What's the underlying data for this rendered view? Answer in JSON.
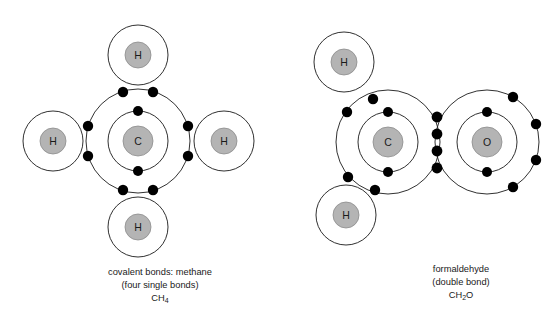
{
  "figure": {
    "background_color": "#ffffff",
    "nucleus_fill": "#b4b4b4",
    "shell_stroke": "#1a1a1a",
    "electron_fill": "#000000"
  },
  "panels": [
    {
      "id": "methane",
      "caption_line1": "covalent bonds: methane",
      "caption_line2": "(four single bonds)",
      "formula_main": "CH",
      "formula_sub": "4",
      "formula_full": "CH4",
      "central_atom": {
        "symbol": "C",
        "name": "carbon",
        "cx": 138,
        "cy": 141,
        "nucleus_r": 15,
        "shells": [
          {
            "r": 30,
            "electrons": 2
          },
          {
            "r": 52,
            "electrons": 8
          }
        ],
        "inner_shell_electron_angles": [
          -90,
          90
        ],
        "bond_count": 4
      },
      "outer_atoms": [
        {
          "symbol": "H",
          "name": "hydrogen",
          "cx": 138,
          "cy": 55,
          "nucleus_r": 13,
          "shell_r": 30,
          "position": "top"
        },
        {
          "symbol": "H",
          "name": "hydrogen",
          "cx": 53,
          "cy": 141,
          "nucleus_r": 13,
          "shell_r": 30,
          "position": "left"
        },
        {
          "symbol": "H",
          "name": "hydrogen",
          "cx": 224,
          "cy": 141,
          "nucleus_r": 13,
          "shell_r": 30,
          "position": "right"
        },
        {
          "symbol": "H",
          "name": "hydrogen",
          "cx": 138,
          "cy": 227,
          "nucleus_r": 13,
          "shell_r": 30,
          "position": "bottom"
        }
      ],
      "bonds": [
        {
          "type": "single",
          "between": "C-H",
          "direction": "up",
          "shared_electrons": 2,
          "dots": [
            {
              "x": 123,
              "y": 92
            },
            {
              "x": 153,
              "y": 92
            }
          ]
        },
        {
          "type": "single",
          "between": "C-H",
          "direction": "left",
          "shared_electrons": 2,
          "dots": [
            {
              "x": 88,
              "y": 126
            },
            {
              "x": 88,
              "y": 156
            }
          ]
        },
        {
          "type": "single",
          "between": "C-H",
          "direction": "right",
          "shared_electrons": 2,
          "dots": [
            {
              "x": 188,
              "y": 126
            },
            {
              "x": 188,
              "y": 156
            }
          ]
        },
        {
          "type": "single",
          "between": "C-H",
          "direction": "down",
          "shared_electrons": 2,
          "dots": [
            {
              "x": 123,
              "y": 190
            },
            {
              "x": 153,
              "y": 190
            }
          ]
        }
      ],
      "caption_x": 160,
      "caption_y": 275
    },
    {
      "id": "formaldehyde",
      "caption_line1": "formaldehyde",
      "caption_line2": "(double bond)",
      "formula_main": "CH",
      "formula_sub": "2",
      "formula_tail": "O",
      "formula_full": "CH2O",
      "central_atom": {
        "symbol": "C",
        "name": "carbon",
        "cx": 388,
        "cy": 142,
        "nucleus_r": 15,
        "shells": [
          {
            "r": 30,
            "electrons": 2
          },
          {
            "r": 52,
            "electrons": 8
          }
        ],
        "inner_shell_electron_angles": [
          -90,
          90
        ],
        "bond_count": 3
      },
      "second_atom": {
        "symbol": "O",
        "name": "oxygen",
        "cx": 487,
        "cy": 142,
        "nucleus_r": 15,
        "shells": [
          {
            "r": 30,
            "electrons": 4
          },
          {
            "r": 52,
            "electrons": 4
          }
        ],
        "inner_shell_electron_angles": [
          -90,
          90
        ],
        "outer_shell_electron_angles": [
          -60,
          -20,
          20,
          60
        ],
        "lone_pairs": 2
      },
      "outer_atoms": [
        {
          "symbol": "H",
          "name": "hydrogen",
          "cx": 344,
          "cy": 62,
          "nucleus_r": 13,
          "shell_r": 30,
          "position": "upper-left"
        },
        {
          "symbol": "H",
          "name": "hydrogen",
          "cx": 346,
          "cy": 215,
          "nucleus_r": 13,
          "shell_r": 30,
          "position": "lower-left"
        }
      ],
      "bonds": [
        {
          "type": "single",
          "between": "C-H",
          "direction": "upper-left",
          "shared_electrons": 2,
          "dots": [
            {
              "x": 373,
              "y": 99
            },
            {
              "x": 347,
              "y": 112
            }
          ]
        },
        {
          "type": "single",
          "between": "C-H",
          "direction": "lower-left",
          "shared_electrons": 2,
          "dots": [
            {
              "x": 348,
              "y": 177
            },
            {
              "x": 375,
              "y": 190
            }
          ]
        },
        {
          "type": "double",
          "between": "C=O",
          "direction": "right",
          "shared_electrons": 4,
          "dots": [
            {
              "x": 437,
              "y": 117
            },
            {
              "x": 437,
              "y": 134
            },
            {
              "x": 437,
              "y": 151
            },
            {
              "x": 437,
              "y": 168
            }
          ]
        }
      ],
      "caption_x": 461,
      "caption_y": 272
    }
  ]
}
